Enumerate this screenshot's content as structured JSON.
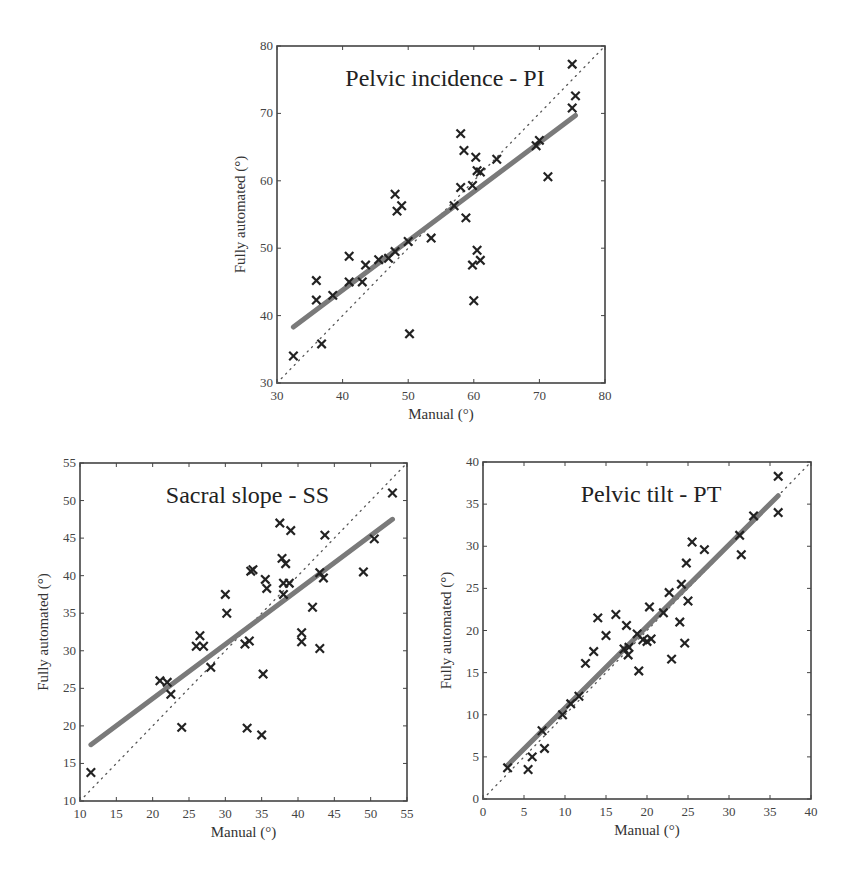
{
  "figure": {
    "marker_color": "#222222",
    "fit_color": "#7a7a7a",
    "frame_color": "#444444"
  },
  "chart_data": [
    {
      "id": "pi",
      "type": "scatter",
      "title": "Pelvic incidence - PI",
      "xlabel": "Manual (°)",
      "ylabel": "Fully automated (°)",
      "xlim": [
        30,
        80
      ],
      "ylim": [
        30,
        80
      ],
      "xticks": [
        30,
        40,
        50,
        60,
        70,
        80
      ],
      "yticks": [
        30,
        40,
        50,
        60,
        70,
        80
      ],
      "frame_px": {
        "left": 277,
        "top": 46,
        "right": 605,
        "bottom": 383
      },
      "identity_line": true,
      "fit_line": [
        [
          32.5,
          38.3
        ],
        [
          75.5,
          69.7
        ]
      ],
      "points": [
        [
          32.5,
          34
        ],
        [
          36,
          45.2
        ],
        [
          36,
          42.3
        ],
        [
          36.8,
          35.8
        ],
        [
          38.5,
          43
        ],
        [
          41,
          48.8
        ],
        [
          41,
          45
        ],
        [
          43,
          45
        ],
        [
          43.5,
          47.5
        ],
        [
          45.5,
          48.3
        ],
        [
          47,
          48.5
        ],
        [
          48,
          49.5
        ],
        [
          48,
          58
        ],
        [
          48.3,
          55.5
        ],
        [
          49,
          56.3
        ],
        [
          50,
          51
        ],
        [
          50.2,
          37.3
        ],
        [
          53.5,
          51.5
        ],
        [
          57,
          56.3
        ],
        [
          58,
          59
        ],
        [
          58,
          67
        ],
        [
          58.5,
          64.5
        ],
        [
          58.8,
          54.5
        ],
        [
          59.8,
          59.3
        ],
        [
          59.8,
          47.5
        ],
        [
          60,
          42.2
        ],
        [
          60.3,
          63.5
        ],
        [
          60.5,
          61.5
        ],
        [
          60.5,
          49.7
        ],
        [
          61,
          48.2
        ],
        [
          61,
          61.3
        ],
        [
          63.5,
          63.2
        ],
        [
          69.5,
          65.2
        ],
        [
          70,
          66
        ],
        [
          71.3,
          60.6
        ],
        [
          75,
          70.8
        ],
        [
          75,
          77.3
        ],
        [
          75.5,
          72.6
        ]
      ]
    },
    {
      "id": "ss",
      "type": "scatter",
      "title": "Sacral slope - SS",
      "xlabel": "Manual (°)",
      "ylabel": "Fully automated (°)",
      "xlim": [
        10,
        55
      ],
      "ylim": [
        10,
        55
      ],
      "xticks": [
        10,
        15,
        20,
        25,
        30,
        35,
        40,
        45,
        50,
        55
      ],
      "yticks": [
        10,
        15,
        20,
        25,
        30,
        35,
        40,
        45,
        50,
        55
      ],
      "frame_px": {
        "left": 80,
        "top": 463,
        "right": 407,
        "bottom": 801
      },
      "identity_line": true,
      "fit_line": [
        [
          11.5,
          17.5
        ],
        [
          53,
          47.5
        ]
      ],
      "points": [
        [
          11.5,
          13.8
        ],
        [
          21,
          26
        ],
        [
          22,
          25.8
        ],
        [
          22.5,
          24.2
        ],
        [
          24,
          19.8
        ],
        [
          26,
          30.6
        ],
        [
          26.5,
          32
        ],
        [
          27,
          30.6
        ],
        [
          28,
          27.8
        ],
        [
          30,
          37.5
        ],
        [
          30.2,
          35
        ],
        [
          32.7,
          30.9
        ],
        [
          33,
          19.7
        ],
        [
          33.3,
          31.3
        ],
        [
          33.5,
          40.6
        ],
        [
          33.8,
          40.8
        ],
        [
          35,
          18.8
        ],
        [
          35.2,
          26.9
        ],
        [
          35.5,
          39.5
        ],
        [
          35.7,
          38.3
        ],
        [
          37.5,
          47
        ],
        [
          37.8,
          42.3
        ],
        [
          38.3,
          41.6
        ],
        [
          38,
          37.5
        ],
        [
          38,
          39
        ],
        [
          38.8,
          39
        ],
        [
          39,
          46
        ],
        [
          40.5,
          32.4
        ],
        [
          40.5,
          31.2
        ],
        [
          42,
          35.8
        ],
        [
          43,
          30.3
        ],
        [
          43,
          40.4
        ],
        [
          43.5,
          39.7
        ],
        [
          43.7,
          45.4
        ],
        [
          49,
          40.5
        ],
        [
          50.5,
          44.9
        ],
        [
          53,
          51
        ]
      ]
    },
    {
      "id": "pt",
      "type": "scatter",
      "title": "Pelvic tilt - PT",
      "xlabel": "Manual (°)",
      "ylabel": "Fully automated (°)",
      "xlim": [
        0,
        40
      ],
      "ylim": [
        0,
        40
      ],
      "xticks": [
        0,
        5,
        10,
        15,
        20,
        25,
        30,
        35,
        40
      ],
      "yticks": [
        0,
        5,
        10,
        15,
        20,
        25,
        30,
        35,
        40
      ],
      "frame_px": {
        "left": 483,
        "top": 462,
        "right": 811,
        "bottom": 799
      },
      "identity_line": true,
      "fit_line": [
        [
          3,
          4
        ],
        [
          36,
          36
        ]
      ],
      "points": [
        [
          3,
          3.7
        ],
        [
          5.5,
          3.5
        ],
        [
          6,
          5
        ],
        [
          7.2,
          8.1
        ],
        [
          7.5,
          6
        ],
        [
          9.7,
          10
        ],
        [
          10.7,
          11.3
        ],
        [
          11.7,
          12.2
        ],
        [
          12.5,
          16.1
        ],
        [
          13.5,
          17.5
        ],
        [
          14,
          21.5
        ],
        [
          15,
          19.4
        ],
        [
          16.2,
          21.9
        ],
        [
          17.2,
          17.8
        ],
        [
          17.5,
          20.6
        ],
        [
          17.7,
          17.1
        ],
        [
          17.8,
          18
        ],
        [
          18.8,
          19.6
        ],
        [
          19,
          15.2
        ],
        [
          19.5,
          18.9
        ],
        [
          20,
          18.7
        ],
        [
          20.5,
          19
        ],
        [
          20.3,
          22.8
        ],
        [
          22,
          22.1
        ],
        [
          22.7,
          24.5
        ],
        [
          23,
          16.6
        ],
        [
          24,
          21
        ],
        [
          24.2,
          25.5
        ],
        [
          24.6,
          18.5
        ],
        [
          24.8,
          28
        ],
        [
          25,
          23.5
        ],
        [
          25.5,
          30.5
        ],
        [
          27,
          29.6
        ],
        [
          31.3,
          31.3
        ],
        [
          31.5,
          29
        ],
        [
          33,
          33.6
        ],
        [
          36,
          34
        ],
        [
          36,
          38.3
        ]
      ]
    }
  ]
}
